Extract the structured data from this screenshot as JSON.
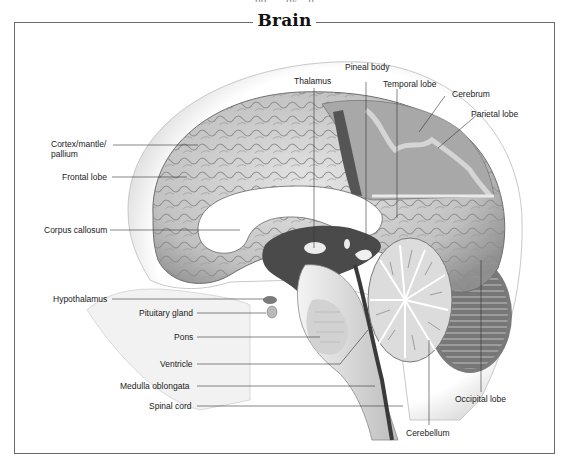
{
  "header": {
    "partial_top_text": "...pp... ...gy ...g...",
    "title": "Brain"
  },
  "diagram": {
    "color_scheme": {
      "background": "#ffffff",
      "frame": "#6a6a6a",
      "label_text": "#1a1a1a",
      "leader_line": "#333333",
      "brain_light": "#d8d8d8",
      "brain_mid": "#a9a9a9",
      "brain_dark": "#5a5a5a",
      "skull": "#efefef"
    },
    "labels_left": [
      {
        "id": "cortex",
        "text": "Cortex/mantle/",
        "text2": "pallium"
      },
      {
        "id": "frontal-lobe",
        "text": "Frontal lobe"
      },
      {
        "id": "corpus-callosum",
        "text": "Corpus callosum"
      },
      {
        "id": "hypothalamus",
        "text": "Hypothalamus"
      },
      {
        "id": "pituitary-gland",
        "text": "Pituitary gland"
      },
      {
        "id": "pons",
        "text": "Pons"
      },
      {
        "id": "ventricle",
        "text": "Ventricle"
      },
      {
        "id": "medulla-oblongata",
        "text": "Medulla oblongata"
      },
      {
        "id": "spinal-cord",
        "text": "Spinal cord"
      }
    ],
    "labels_top": [
      {
        "id": "thalamus",
        "text": "Thalamus"
      },
      {
        "id": "pineal-body",
        "text": "Pineal body"
      },
      {
        "id": "temporal-lobe",
        "text": "Temporal lobe"
      },
      {
        "id": "cerebrum",
        "text": "Cerebrum"
      },
      {
        "id": "parietal-lobe",
        "text": "Parietal lobe"
      }
    ],
    "labels_bottom": [
      {
        "id": "occipital-lobe",
        "text": "Occipital lobe"
      },
      {
        "id": "cerebellum",
        "text": "Cerebellum"
      }
    ]
  }
}
